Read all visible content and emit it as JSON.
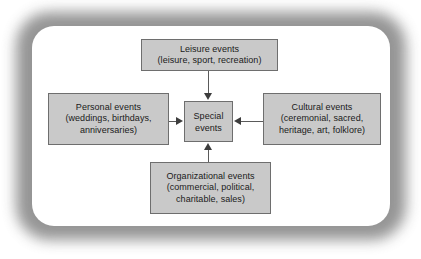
{
  "diagram": {
    "colors": {
      "box_fill": "#c9c9c9",
      "box_border": "#6e6e6e",
      "frame": "#8c8c8c",
      "panel": "#ffffff",
      "connector": "#5a5a5a",
      "arrowhead": "#3d3d3d",
      "text": "#1a1a1a"
    },
    "center": {
      "line1": "Special",
      "line2": "events"
    },
    "nodes": [
      {
        "id": "leisure",
        "position": "top",
        "heading": "Leisure events",
        "detail": "(leisure, sport, recreation)",
        "arrow": "down"
      },
      {
        "id": "personal",
        "position": "left",
        "heading": "Personal events",
        "detail_line1": "(weddings, birthdays,",
        "detail_line2": "anniversaries)",
        "arrow": "right"
      },
      {
        "id": "cultural",
        "position": "right",
        "heading": "Cultural events",
        "detail_line1": "(ceremonial, sacred,",
        "detail_line2": "heritage, art, folklore)",
        "arrow": "left"
      },
      {
        "id": "organizational",
        "position": "bottom",
        "heading": "Organizational events",
        "detail_line1": "(commercial, political,",
        "detail_line2": "charitable, sales)",
        "arrow": "up"
      }
    ]
  }
}
